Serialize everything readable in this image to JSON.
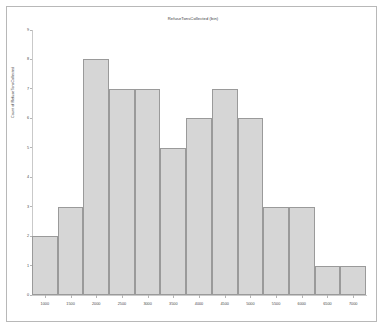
{
  "chart_data": {
    "type": "bar",
    "title": "RefuseTonsCollected (bin)",
    "xlabel": "",
    "ylabel": "Count of RefuseTonsCollected",
    "categories": [
      "1000",
      "1500",
      "2000",
      "2500",
      "3000",
      "3500",
      "4000",
      "4500",
      "5000",
      "5500",
      "6000",
      "6500",
      "7000"
    ],
    "values": [
      2,
      3,
      8,
      7,
      7,
      5,
      6,
      7,
      6,
      3,
      3,
      1,
      1
    ],
    "xtick_labels": [
      "1000",
      "1500",
      "2000",
      "2500",
      "3000",
      "3500",
      "4000",
      "4500",
      "5000",
      "5500",
      "6000",
      "6500",
      "7000"
    ],
    "ytick_labels": [
      "0",
      "1",
      "2",
      "3",
      "4",
      "5",
      "6",
      "7",
      "8",
      "9"
    ],
    "ylim": [
      0,
      9
    ],
    "grid": false,
    "legend": false,
    "bar_fill_color": "#d6d6d6",
    "bar_border_color": "#9a9a9a",
    "axis_color": "#c9c9c9",
    "text_color": "#3a3a3a",
    "background_color": "#ffffff",
    "frame_color": "#b8b8b8"
  }
}
